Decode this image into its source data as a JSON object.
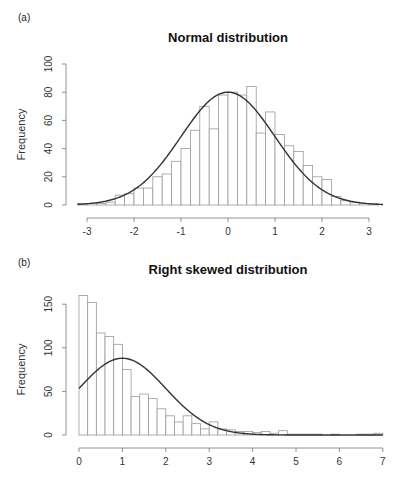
{
  "chart_data": [
    {
      "type": "bar",
      "panel_label": "(a)",
      "title": "Normal distribution",
      "xlabel": "",
      "ylabel": "Frequency",
      "xlim": [
        -3.2,
        3.2
      ],
      "ylim": [
        0,
        100
      ],
      "x_ticks": [
        -3,
        -2,
        -1,
        0,
        1,
        2,
        3
      ],
      "y_ticks": [
        0,
        20,
        40,
        60,
        80,
        100
      ],
      "bin_width": 0.2,
      "bin_starts": [
        -3.2,
        -3.0,
        -2.8,
        -2.6,
        -2.4,
        -2.2,
        -2.0,
        -1.8,
        -1.6,
        -1.4,
        -1.2,
        -1.0,
        -0.8,
        -0.6,
        -0.4,
        -0.2,
        0.0,
        0.2,
        0.4,
        0.6,
        0.8,
        1.0,
        1.2,
        1.4,
        1.6,
        1.8,
        2.0,
        2.2,
        2.4,
        2.6,
        2.8,
        3.0
      ],
      "values": [
        1,
        1,
        1,
        2,
        7,
        8,
        12,
        12,
        20,
        22,
        31,
        40,
        53,
        70,
        54,
        78,
        80,
        78,
        84,
        51,
        66,
        50,
        42,
        38,
        28,
        20,
        18,
        6,
        3,
        2,
        1,
        1
      ],
      "overlay_curve": {
        "type": "normal_density",
        "mean": 0,
        "sd": 1,
        "peak": 80
      },
      "grid": false,
      "legend": null
    },
    {
      "type": "bar",
      "panel_label": "(b)",
      "title": "Right skewed distribution",
      "xlabel": "",
      "ylabel": "Frequency",
      "xlim": [
        0,
        7
      ],
      "ylim": [
        0,
        170
      ],
      "x_ticks": [
        0,
        1,
        2,
        3,
        4,
        5,
        6,
        7
      ],
      "y_ticks": [
        0,
        50,
        100,
        150
      ],
      "bin_width": 0.2,
      "bin_starts": [
        0.0,
        0.2,
        0.4,
        0.6,
        0.8,
        1.0,
        1.2,
        1.4,
        1.6,
        1.8,
        2.0,
        2.2,
        2.4,
        2.6,
        2.8,
        3.0,
        3.2,
        3.4,
        3.6,
        3.8,
        4.0,
        4.2,
        4.4,
        4.6,
        4.8,
        5.0,
        5.2,
        5.4,
        5.6,
        5.8,
        6.0,
        6.2,
        6.4,
        6.6,
        6.8
      ],
      "values": [
        160,
        152,
        117,
        113,
        104,
        75,
        44,
        47,
        42,
        30,
        22,
        15,
        22,
        13,
        7,
        15,
        7,
        6,
        4,
        4,
        3,
        4,
        2,
        5,
        1,
        1,
        1,
        1,
        0,
        1,
        0,
        0,
        1,
        1,
        2
      ],
      "overlay_curve": {
        "type": "normal_density",
        "mean": 1.0,
        "sd": 1.0,
        "peak": 88
      },
      "grid": false,
      "legend": null
    }
  ]
}
